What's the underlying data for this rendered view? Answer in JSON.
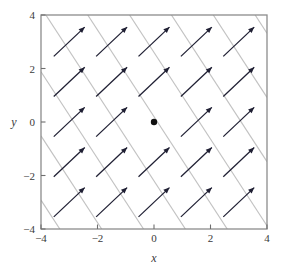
{
  "chart_data": {
    "type": "scatter",
    "title": "",
    "subtitle": "",
    "xlabel": "x",
    "ylabel": "y",
    "xlim": [
      -4,
      4
    ],
    "ylim": [
      -4,
      4
    ],
    "xticks": [
      -4,
      -2,
      0,
      2,
      4
    ],
    "yticks": [
      -4,
      -2,
      0,
      2,
      4
    ],
    "xtick_labels": [
      "−4",
      "−2",
      "0",
      "2",
      "4"
    ],
    "ytick_labels": [
      "−4",
      "−2",
      "0",
      "2",
      "4"
    ],
    "grid": false,
    "legend": "none",
    "annotations": [],
    "series": [
      {
        "name": "direction-field-arrows",
        "kind": "vector-field",
        "color": "#1f1f33",
        "arrow_slope": 1.0,
        "arrow_angle_deg": 45,
        "arrow_length": 1.55,
        "grid_x": [
          -3,
          -1.5,
          0,
          1.5,
          3
        ],
        "grid_y": [
          -3,
          -1.5,
          0,
          1.5,
          3
        ],
        "vectors": [
          {
            "x": -3,
            "y": 3,
            "u": 1,
            "v": 1
          },
          {
            "x": -1.5,
            "y": 3,
            "u": 1,
            "v": 1
          },
          {
            "x": 0,
            "y": 3,
            "u": 1,
            "v": 1
          },
          {
            "x": 1.5,
            "y": 3,
            "u": 1,
            "v": 1
          },
          {
            "x": 3,
            "y": 3,
            "u": 1,
            "v": 1
          },
          {
            "x": -3,
            "y": 1.5,
            "u": 1,
            "v": 1
          },
          {
            "x": -1.5,
            "y": 1.5,
            "u": 1,
            "v": 1
          },
          {
            "x": 0,
            "y": 1.5,
            "u": 1,
            "v": 1
          },
          {
            "x": 1.5,
            "y": 1.5,
            "u": 1,
            "v": 1
          },
          {
            "x": 3,
            "y": 1.5,
            "u": 1,
            "v": 1
          },
          {
            "x": -3,
            "y": 0,
            "u": 1,
            "v": 1
          },
          {
            "x": -1.5,
            "y": 0,
            "u": 1,
            "v": 1
          },
          {
            "x": 1.5,
            "y": 0,
            "u": 1,
            "v": 1
          },
          {
            "x": 3,
            "y": 0,
            "u": 1,
            "v": 1
          },
          {
            "x": -3,
            "y": -1.5,
            "u": 1,
            "v": 1
          },
          {
            "x": -1.5,
            "y": -1.5,
            "u": 1,
            "v": 1
          },
          {
            "x": 0,
            "y": -1.5,
            "u": 1,
            "v": 1
          },
          {
            "x": 1.5,
            "y": -1.5,
            "u": 1,
            "v": 1
          },
          {
            "x": 3,
            "y": -1.5,
            "u": 1,
            "v": 1
          },
          {
            "x": -3,
            "y": -3,
            "u": 1,
            "v": 1
          },
          {
            "x": -1.5,
            "y": -3,
            "u": 1,
            "v": 1
          },
          {
            "x": 0,
            "y": -3,
            "u": 1,
            "v": 1
          },
          {
            "x": 1.5,
            "y": -3,
            "u": 1,
            "v": 1
          },
          {
            "x": 3,
            "y": -3,
            "u": 1,
            "v": 1
          }
        ]
      },
      {
        "name": "trajectory-lines",
        "kind": "lines",
        "color": "#c2c2c2",
        "slope": -1.62,
        "intercepts": [
          -9.4,
          -7.0,
          -4.6,
          -2.2,
          0.2,
          2.6,
          5.0,
          7.4,
          9.8
        ]
      },
      {
        "name": "equilibrium-point",
        "kind": "point",
        "color": "#101010",
        "points": [
          {
            "x": 0,
            "y": 0
          }
        ],
        "marker_radius": 3.2
      }
    ]
  },
  "axes": {
    "frame_color": "#8c8c8c",
    "tick_color": "#6e6e6e",
    "x_title": "x",
    "y_title": "y"
  }
}
